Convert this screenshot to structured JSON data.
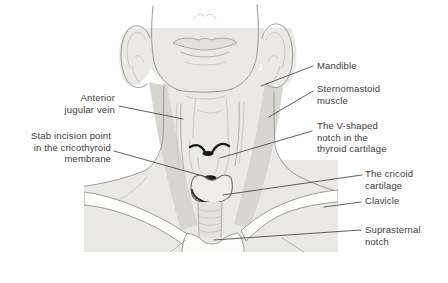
{
  "diagram": {
    "labels": {
      "anterior_jugular_vein": "Anterior\njugular vein",
      "stab_incision": "Stab incision point\nin the cricothyroid\nmembrane",
      "mandible": "Mandible",
      "sternomastoid": "Sternomastoid\nmuscle",
      "v_notch": "The V-shaped\nnotch in the\nthyroid cartilage",
      "cricoid": "The cricoid\ncartilage",
      "clavicle": "Clavicle",
      "suprasternal": "Suprasternal\nnotch"
    }
  },
  "colors": {
    "page-bg": "#ffffff",
    "skin": "#ebe9e5",
    "muscle": "#d8d6d1",
    "outline": "#9c9a96",
    "faint": "#c3c1bd",
    "dark": "#1a1a19",
    "leader": "#4d4d4b",
    "text": "#3c3c3c",
    "struct": "#fdfdfc"
  }
}
